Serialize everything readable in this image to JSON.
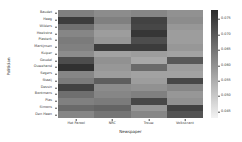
{
  "chart_data": {
    "type": "heatmap",
    "title": "",
    "xlabel": "Newspaper",
    "ylabel": "Politician",
    "categories_x": [
      "Het Parool",
      "NRC",
      "Trouw",
      "Volkskrant"
    ],
    "categories_y": [
      "Baudet",
      "Haag",
      "Wilders",
      "Hoekstra",
      "Plasterk",
      "Martijnsen",
      "Kuiper",
      "Goudel",
      "Ouwehand",
      "Segers",
      "Staaij",
      "Dessin",
      "Bontmans",
      "Plas",
      "Simons",
      "Den Haan"
    ],
    "colormap": "gray_r",
    "cbar_ticks": [
      0.045,
      0.05,
      0.055,
      0.06,
      0.065,
      0.07,
      0.075
    ],
    "cbar_tick_labels": [
      "0.045",
      "0.050",
      "0.055",
      "0.060",
      "0.065",
      "0.070",
      "0.075"
    ],
    "zlim": [
      0.043,
      0.078
    ],
    "grid": false,
    "legend_position": "right-colorbar",
    "values": [
      [
        0.063,
        0.061,
        0.062,
        0.06
      ],
      [
        0.075,
        0.063,
        0.074,
        0.061
      ],
      [
        0.066,
        0.06,
        0.073,
        0.059
      ],
      [
        0.062,
        0.058,
        0.076,
        0.058
      ],
      [
        0.064,
        0.059,
        0.072,
        0.058
      ],
      [
        0.063,
        0.075,
        0.075,
        0.059
      ],
      [
        0.061,
        0.057,
        0.058,
        0.057
      ],
      [
        0.072,
        0.06,
        0.056,
        0.07
      ],
      [
        0.077,
        0.059,
        0.067,
        0.058
      ],
      [
        0.062,
        0.058,
        0.057,
        0.057
      ],
      [
        0.064,
        0.069,
        0.058,
        0.073
      ],
      [
        0.074,
        0.061,
        0.06,
        0.062
      ],
      [
        0.066,
        0.062,
        0.063,
        0.059
      ],
      [
        0.063,
        0.064,
        0.073,
        0.06
      ],
      [
        0.067,
        0.068,
        0.059,
        0.074
      ],
      [
        0.062,
        0.065,
        0.062,
        0.071
      ]
    ]
  }
}
